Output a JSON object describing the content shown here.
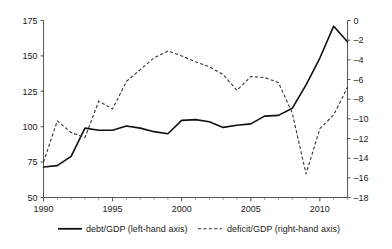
{
  "chart_data": {
    "type": "line",
    "title": "",
    "subtitle": "",
    "xlabel": "",
    "ylabel": "",
    "y2label": "",
    "grid": false,
    "legend_position": "bottom",
    "x": [
      1990,
      1991,
      1992,
      1993,
      1994,
      1995,
      1996,
      1997,
      1998,
      1999,
      2000,
      2001,
      2002,
      2003,
      2004,
      2005,
      2006,
      2007,
      2008,
      2009,
      2010,
      2011,
      2012
    ],
    "xlim": [
      1990,
      2012
    ],
    "xticks": [
      1990,
      1995,
      2000,
      2005,
      2010
    ],
    "xtick_labels": [
      "1990",
      "1995",
      "2000",
      "2005",
      "2010"
    ],
    "xticks_minor_step": 1,
    "ylim": [
      50,
      175
    ],
    "yticks": [
      50,
      75,
      100,
      125,
      150,
      175
    ],
    "ytick_labels": [
      "50",
      "75",
      "100",
      "125",
      "150",
      "175"
    ],
    "y2lim": [
      -18,
      0
    ],
    "y2ticks": [
      -18,
      -16,
      -14,
      -12,
      -10,
      -8,
      -6,
      -4,
      -2,
      0
    ],
    "y2tick_labels": [
      "–18",
      "–16",
      "–14",
      "–12",
      "–10",
      "–8",
      "–6",
      "–4",
      "–2",
      "0"
    ],
    "series": [
      {
        "name": "debt/GDP (left-hand axis)",
        "axis": "left",
        "style": "solid",
        "color": "#111111",
        "values": [
          71.5,
          72.5,
          79.0,
          99.0,
          97.5,
          97.5,
          100.5,
          99.0,
          96.5,
          95.0,
          104.5,
          105.0,
          103.5,
          99.5,
          101.0,
          102.0,
          107.5,
          108.0,
          113.0,
          129.5,
          148.5,
          171.0,
          160.0
        ]
      },
      {
        "name": "deficit/GDP (right-hand axis)",
        "axis": "right",
        "style": "dashed",
        "color": "#333333",
        "values": [
          -14.4,
          -10.2,
          -11.4,
          -11.9,
          -8.2,
          -9.0,
          -6.2,
          -5.0,
          -3.8,
          -3.1,
          -3.6,
          -4.2,
          -4.7,
          -5.5,
          -7.1,
          -5.7,
          -5.8,
          -6.3,
          -9.4,
          -15.6,
          -11.0,
          -9.6,
          -6.8
        ]
      }
    ],
    "legend": [
      {
        "label": "debt/GDP (left-hand axis)",
        "style": "solid",
        "color": "#111111"
      },
      {
        "label": "deficit/GDP (right-hand axis)",
        "style": "dashed",
        "color": "#333333"
      }
    ]
  },
  "colors": {
    "background": "#ffffff",
    "axis": "#555555",
    "solid_series": "#111111",
    "dashed_series": "#333333",
    "text": "#1a1a1a"
  }
}
